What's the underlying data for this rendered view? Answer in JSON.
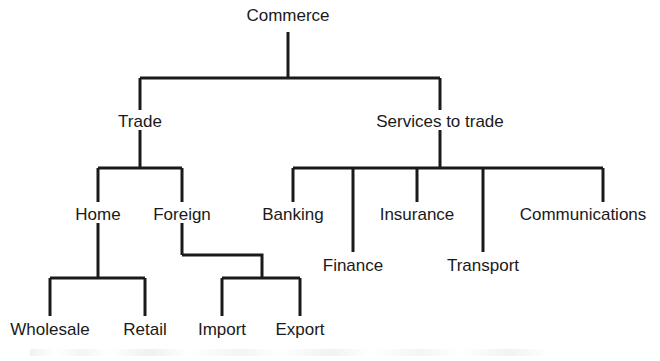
{
  "diagram": {
    "title": "Commerce",
    "type": "hierarchy-tree",
    "line_color": "#1a1a1a",
    "text_color": "#1a1a1a",
    "background_color": "#ffffff",
    "nodes": {
      "root": {
        "label": "Commerce",
        "x": 288,
        "y": 16
      },
      "trade": {
        "label": "Trade",
        "x": 140,
        "y": 122
      },
      "services": {
        "label": "Services to trade",
        "x": 440,
        "y": 122
      },
      "home": {
        "label": "Home",
        "x": 98,
        "y": 215
      },
      "foreign": {
        "label": "Foreign",
        "x": 182,
        "y": 215
      },
      "banking": {
        "label": "Banking",
        "x": 293,
        "y": 215
      },
      "insurance": {
        "label": "Insurance",
        "x": 417,
        "y": 215
      },
      "communications": {
        "label": "Communications",
        "x": 583,
        "y": 215
      },
      "finance": {
        "label": "Finance",
        "x": 353,
        "y": 266
      },
      "transport": {
        "label": "Transport",
        "x": 483,
        "y": 266
      },
      "wholesale": {
        "label": "Wholesale",
        "x": 50,
        "y": 330
      },
      "retail": {
        "label": "Retail",
        "x": 145,
        "y": 330
      },
      "import": {
        "label": "Import",
        "x": 222,
        "y": 330
      },
      "export": {
        "label": "Export",
        "x": 300,
        "y": 330
      }
    },
    "edges": [
      {
        "from": "root",
        "to": "trade"
      },
      {
        "from": "root",
        "to": "services"
      },
      {
        "from": "trade",
        "to": "home"
      },
      {
        "from": "trade",
        "to": "foreign"
      },
      {
        "from": "services",
        "to": "banking"
      },
      {
        "from": "services",
        "to": "finance"
      },
      {
        "from": "services",
        "to": "insurance"
      },
      {
        "from": "services",
        "to": "transport"
      },
      {
        "from": "services",
        "to": "communications"
      },
      {
        "from": "home",
        "to": "wholesale"
      },
      {
        "from": "home",
        "to": "retail"
      },
      {
        "from": "foreign",
        "to": "import"
      },
      {
        "from": "foreign",
        "to": "export"
      }
    ]
  }
}
